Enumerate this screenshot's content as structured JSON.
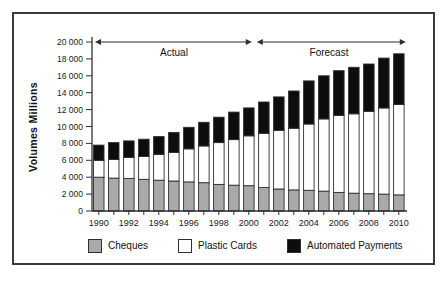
{
  "colors": {
    "background": "#ffffff",
    "frame": "#3a3a3a",
    "axis": "#2e2e2e",
    "text": "#1a1a1a",
    "bar_stroke": "#2e2e2e"
  },
  "legend": {
    "items": [
      {
        "label": "Cheques",
        "color": "#a9a9a9"
      },
      {
        "label": "Plastic Cards",
        "color": "#ffffff"
      },
      {
        "label": "Automated Payments",
        "color": "#0d0d0d"
      }
    ]
  },
  "chart_data": {
    "type": "bar",
    "stacked": true,
    "title": "",
    "xlabel": "",
    "ylabel": "Volumes Millions",
    "ylim": [
      0,
      20000
    ],
    "ytick_step": 2000,
    "grid": false,
    "legend_position": "bottom",
    "xtick_label_step": 2,
    "categories": [
      1990,
      1991,
      1992,
      1993,
      1994,
      1995,
      1996,
      1997,
      1998,
      1999,
      2000,
      2001,
      2002,
      2003,
      2004,
      2005,
      2006,
      2007,
      2008,
      2009,
      2010
    ],
    "series": [
      {
        "name": "Cheques",
        "color": "#a9a9a9",
        "values": [
          4000,
          3900,
          3850,
          3750,
          3650,
          3550,
          3450,
          3350,
          3150,
          3050,
          3000,
          2800,
          2600,
          2500,
          2450,
          2350,
          2200,
          2100,
          2050,
          2000,
          1900
        ]
      },
      {
        "name": "Plastic Cards",
        "color": "#ffffff",
        "values": [
          2000,
          2200,
          2500,
          2700,
          3050,
          3400,
          3900,
          4350,
          4950,
          5400,
          5900,
          6400,
          6950,
          7300,
          7850,
          8550,
          9100,
          9400,
          9750,
          10200,
          10700
        ]
      },
      {
        "name": "Automated Payments",
        "color": "#0d0d0d",
        "values": [
          1800,
          2000,
          1950,
          2050,
          2100,
          2350,
          2550,
          2800,
          3000,
          3250,
          3300,
          3700,
          3950,
          4400,
          5100,
          5100,
          5300,
          5500,
          5600,
          5900,
          6000
        ]
      }
    ],
    "totals": [
      7800,
      8100,
      8300,
      8500,
      8800,
      9300,
      9900,
      10500,
      11100,
      11700,
      12200,
      12900,
      13500,
      14200,
      15400,
      16000,
      16600,
      17000,
      17400,
      18100,
      18600
    ],
    "annotations": [
      {
        "label": "Actual",
        "from_year": 1990,
        "to_year": 2000
      },
      {
        "label": "Forecast",
        "from_year": 2001,
        "to_year": 2010
      }
    ]
  }
}
